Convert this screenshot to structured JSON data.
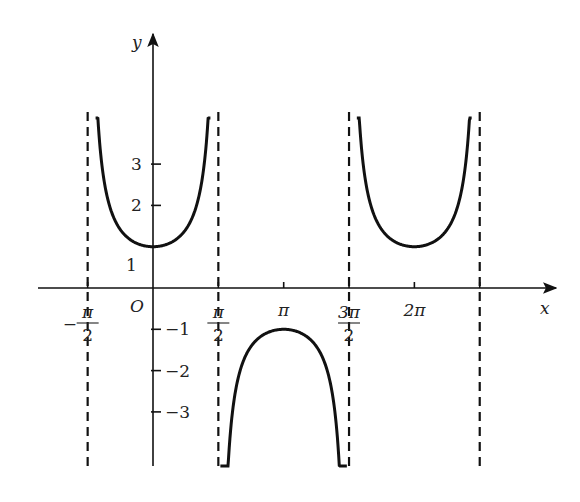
{
  "chart_data": {
    "type": "line",
    "title": "",
    "function": "y = sec x = 1/cos x",
    "xlabel": "x",
    "ylabel": "y",
    "origin_label": "O",
    "x_ticks": [
      {
        "value": -1.5708,
        "label_num": "π",
        "label_den": "2",
        "sign": "−"
      },
      {
        "value": 1.5708,
        "label_num": "π",
        "label_den": "2",
        "sign": ""
      },
      {
        "value": 3.1416,
        "label": "π"
      },
      {
        "value": 4.7124,
        "label_num": "3π",
        "label_den": "2",
        "sign": ""
      },
      {
        "value": 6.2832,
        "label": "2π"
      },
      {
        "value": 7.854,
        "label": ""
      }
    ],
    "y_ticks": [
      {
        "value": 3,
        "label": "3"
      },
      {
        "value": 2,
        "label": "2"
      },
      {
        "value": 1,
        "label": "1"
      },
      {
        "value": -1,
        "label": "−1"
      },
      {
        "value": -2,
        "label": "−2"
      },
      {
        "value": -3,
        "label": "−3"
      }
    ],
    "asymptotes_x": [
      -1.5708,
      1.5708,
      4.7124,
      7.854
    ],
    "series": [
      {
        "name": "branch-1",
        "x_range": [
          -1.38,
          1.38
        ],
        "extremum": {
          "x": 0,
          "y": 1,
          "type": "min"
        }
      },
      {
        "name": "branch-2",
        "x_range": [
          1.62,
          4.66
        ],
        "extremum": {
          "x": 3.1416,
          "y": -1,
          "type": "max"
        }
      },
      {
        "name": "branch-3",
        "x_range": [
          4.9,
          7.66
        ],
        "extremum": {
          "x": 6.2832,
          "y": 1,
          "type": "min"
        }
      }
    ],
    "xlim": [
      -1.75,
      8.2
    ],
    "ylim": [
      -4.2,
      6.2
    ],
    "grid": false,
    "legend": null
  },
  "layout": {
    "origin_px": [
      153,
      288
    ],
    "px_per_x_unit": 41.6,
    "px_per_y_unit": 41.3,
    "curve_color": "#111111",
    "axis_color": "#111111"
  }
}
